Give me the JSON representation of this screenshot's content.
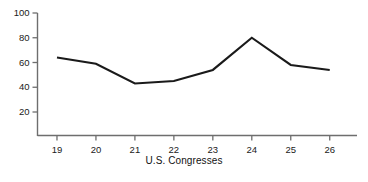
{
  "chart_data": {
    "type": "line",
    "title": "",
    "xlabel": "U.S. Congresses",
    "ylabel": "",
    "categories": [
      "19",
      "20",
      "21",
      "22",
      "23",
      "24",
      "25",
      "26"
    ],
    "x": [
      19,
      20,
      21,
      22,
      23,
      24,
      25,
      26
    ],
    "values": [
      64,
      59,
      43,
      45,
      54,
      80,
      58,
      54
    ],
    "series": [
      {
        "name": "series-1",
        "values": [
          64,
          59,
          43,
          45,
          54,
          80,
          58,
          54
        ],
        "color": "#1a1a1a"
      }
    ],
    "xlim": [
      18.5,
      26.7
    ],
    "ylim": [
      8,
      100
    ],
    "ytick_values": [
      20,
      40,
      60,
      80,
      100
    ],
    "ytick_labels": [
      "20",
      "40",
      "60",
      "80",
      "100"
    ],
    "xtick_labels": [
      "19",
      "20",
      "21",
      "22",
      "23",
      "24",
      "25",
      "26"
    ],
    "grid": false,
    "legend": false,
    "line_color": "#1a1a1a",
    "axis_color": "#6e6e6e",
    "background": "#ffffff"
  }
}
